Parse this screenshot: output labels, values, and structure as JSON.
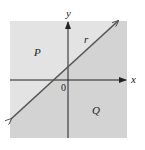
{
  "diagram": {
    "type": "half-plane partition",
    "region_above": {
      "label": "P",
      "fill": "#e3e3e3"
    },
    "region_below": {
      "label": "Q",
      "fill": "#d3d3d3"
    },
    "line": {
      "label": "r",
      "color": "#555555"
    },
    "axes": {
      "x_label": "x",
      "y_label": "y",
      "origin_label": "0",
      "color": "#222222"
    }
  }
}
